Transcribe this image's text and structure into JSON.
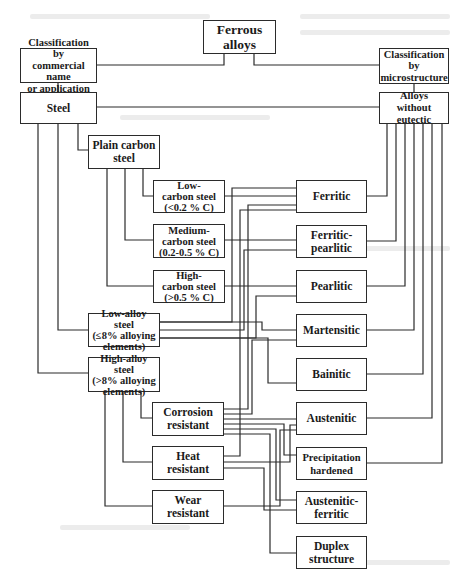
{
  "diagram": {
    "title": "Ferrous alloys",
    "nodes": {
      "ferrous_alloys": "Ferrous\nalloys",
      "class_commercial": "Classification by\ncommercial name\nor application",
      "class_micro": "Classification\nby\nmicrostructure",
      "steel": "Steel",
      "alloys_without_eutectic": "Alloys without\neutectic",
      "plain_carbon": "Plain carbon\nsteel",
      "low_carbon": "Low-\ncarbon steel\n(<0.2 % C)",
      "medium_carbon": "Medium-\ncarbon steel\n(0.2-0.5 % C)",
      "high_carbon": "High-\ncarbon steel\n(>0.5 % C)",
      "low_alloy": "Low-alloy steel\n(≤8% alloying\nelements)",
      "high_alloy": "High-alloy steel\n(>8% alloying\nelements)",
      "corrosion": "Corrosion\nresistant",
      "heat": "Heat\nresistant",
      "wear": "Wear\nresistant",
      "ferritic": "Ferritic",
      "ferritic_pearlitic": "Ferritic-\npearlitic",
      "pearlitic": "Pearlitic",
      "martensitic": "Martensitic",
      "bainitic": "Bainitic",
      "austenitic": "Austenitic",
      "precipitation": "Precipitation\nhardened",
      "austenitic_ferritic": "Austenitic-\nferritic",
      "duplex": "Duplex\nstructure"
    },
    "edges": [
      [
        "ferrous_alloys",
        "class_commercial"
      ],
      [
        "ferrous_alloys",
        "class_micro"
      ],
      [
        "class_commercial",
        "steel"
      ],
      [
        "class_micro",
        "alloys_without_eutectic"
      ],
      [
        "steel",
        "alloys_without_eutectic"
      ],
      [
        "steel",
        "plain_carbon"
      ],
      [
        "steel",
        "low_alloy"
      ],
      [
        "steel",
        "high_alloy"
      ],
      [
        "plain_carbon",
        "low_carbon"
      ],
      [
        "plain_carbon",
        "medium_carbon"
      ],
      [
        "plain_carbon",
        "high_carbon"
      ],
      [
        "high_alloy",
        "corrosion"
      ],
      [
        "high_alloy",
        "heat"
      ],
      [
        "high_alloy",
        "wear"
      ],
      [
        "alloys_without_eutectic",
        "ferritic"
      ],
      [
        "alloys_without_eutectic",
        "ferritic_pearlitic"
      ],
      [
        "alloys_without_eutectic",
        "pearlitic"
      ],
      [
        "alloys_without_eutectic",
        "martensitic"
      ],
      [
        "alloys_without_eutectic",
        "bainitic"
      ],
      [
        "alloys_without_eutectic",
        "austenitic"
      ],
      [
        "alloys_without_eutectic",
        "precipitation"
      ],
      [
        "low_carbon",
        "ferritic"
      ],
      [
        "medium_carbon",
        "ferritic_pearlitic"
      ],
      [
        "high_carbon",
        "pearlitic"
      ],
      [
        "low_alloy",
        "ferritic"
      ],
      [
        "low_alloy",
        "ferritic_pearlitic"
      ],
      [
        "low_alloy",
        "pearlitic"
      ],
      [
        "low_alloy",
        "martensitic"
      ],
      [
        "low_alloy",
        "bainitic"
      ],
      [
        "corrosion",
        "ferritic"
      ],
      [
        "corrosion",
        "martensitic"
      ],
      [
        "corrosion",
        "austenitic"
      ],
      [
        "corrosion",
        "precipitation"
      ],
      [
        "corrosion",
        "austenitic_ferritic"
      ],
      [
        "corrosion",
        "duplex"
      ],
      [
        "heat",
        "ferritic"
      ],
      [
        "heat",
        "austenitic"
      ],
      [
        "heat",
        "austenitic_ferritic"
      ],
      [
        "wear",
        "austenitic"
      ]
    ]
  }
}
